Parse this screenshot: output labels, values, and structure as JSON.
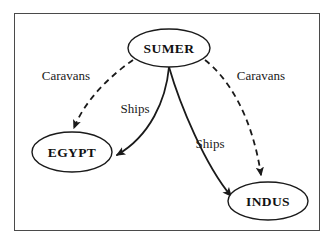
{
  "figure": {
    "kind": "trade-network-diagram",
    "border_color": "#4a4a4a",
    "background": "#ffffff",
    "stroke_color": "#1a1a1a"
  },
  "nodes": [
    {
      "id": "sumer",
      "label": "SUMER",
      "cx": 169,
      "cy": 48,
      "rx": 41,
      "ry": 19
    },
    {
      "id": "egypt",
      "label": "EGYPT",
      "cx": 72,
      "cy": 152,
      "rx": 40,
      "ry": 20
    },
    {
      "id": "indus",
      "label": "INDUS",
      "cx": 268,
      "cy": 201,
      "rx": 40,
      "ry": 19
    }
  ],
  "edges": [
    {
      "id": "sumer-egypt-caravans",
      "from": "sumer",
      "to": "egypt",
      "label": "Caravans",
      "style": "dashed",
      "label_x": 66,
      "label_y": 80
    },
    {
      "id": "sumer-indus-caravans",
      "from": "sumer",
      "to": "indus",
      "label": "Caravans",
      "style": "dashed",
      "label_x": 261,
      "label_y": 80
    },
    {
      "id": "sumer-egypt-ships",
      "from": "sumer",
      "to": "egypt",
      "label": "Ships",
      "style": "solid",
      "label_x": 135,
      "label_y": 113
    },
    {
      "id": "sumer-indus-ships",
      "from": "sumer",
      "to": "indus",
      "label": "Ships",
      "style": "solid",
      "label_x": 210,
      "label_y": 148
    }
  ]
}
